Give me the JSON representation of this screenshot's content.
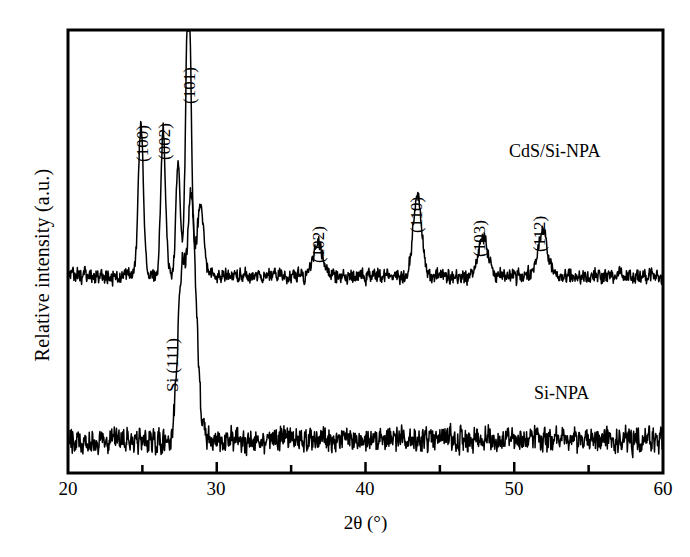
{
  "chart_data": {
    "type": "line",
    "title": "",
    "xlabel": "2θ (°)",
    "ylabel": "Relative intensity (a.u.)",
    "xlim": [
      20,
      60
    ],
    "xticks": [
      20,
      30,
      40,
      50,
      60
    ],
    "xticklabels": [
      "20",
      "30",
      "40",
      "50",
      "60"
    ],
    "xminorticks": [
      25,
      35,
      45,
      55
    ],
    "yticks": [],
    "yticklabels": [],
    "grid": false,
    "legend_position": "inline-right",
    "line_color": "#000000",
    "frame_color": "#000000",
    "background": "#ffffff",
    "series": [
      {
        "name": "CdS/Si-NPA",
        "label_position": {
          "x2theta": 51.0,
          "y_frac": 0.77
        },
        "baseline_frac": 0.445,
        "noise_amplitude_frac": 0.018,
        "peaks": [
          {
            "hkl": "(100)",
            "two_theta": 24.9,
            "height_frac": 0.345,
            "width": 0.17,
            "labeled": true
          },
          {
            "hkl": "(002)",
            "two_theta": 26.4,
            "height_frac": 0.33,
            "width": 0.16,
            "labeled": true
          },
          {
            "hkl": "(101)",
            "two_theta": 28.1,
            "height_frac": 0.7,
            "width": 0.17,
            "labeled": true
          },
          {
            "hkl": "",
            "two_theta": 27.4,
            "height_frac": 0.25,
            "width": 0.15,
            "labeled": false
          },
          {
            "hkl": "",
            "two_theta": 28.9,
            "height_frac": 0.16,
            "width": 0.22,
            "labeled": false
          },
          {
            "hkl": "(102)",
            "two_theta": 36.8,
            "height_frac": 0.075,
            "width": 0.3,
            "labeled": true
          },
          {
            "hkl": "(110)",
            "two_theta": 43.5,
            "height_frac": 0.185,
            "width": 0.28,
            "labeled": true
          },
          {
            "hkl": "(103)",
            "two_theta": 47.9,
            "height_frac": 0.09,
            "width": 0.3,
            "labeled": true
          },
          {
            "hkl": "(112)",
            "two_theta": 51.9,
            "height_frac": 0.105,
            "width": 0.3,
            "labeled": true
          }
        ]
      },
      {
        "name": "Si-NPA",
        "label_position": {
          "x2theta": 51.5,
          "y_frac": 0.235
        },
        "baseline_frac": 0.075,
        "noise_amplitude_frac": 0.03,
        "peaks": [
          {
            "hkl": "Si (111)",
            "two_theta": 28.3,
            "height_frac": 0.54,
            "width": 0.32,
            "labeled": true
          },
          {
            "hkl": "",
            "two_theta": 27.6,
            "height_frac": 0.33,
            "width": 0.25,
            "labeled": false
          }
        ]
      }
    ],
    "peak_label_annotations": [
      {
        "text": "(100)",
        "two_theta": 24.9,
        "anchor_y_frac": 0.4
      },
      {
        "text": "(002)",
        "two_theta": 26.4,
        "anchor_y_frac": 0.39
      },
      {
        "text": "(101)",
        "two_theta": 28.1,
        "anchor_y_frac": 0.755
      },
      {
        "text": "(102)",
        "two_theta": 36.7,
        "anchor_y_frac": 0.125
      },
      {
        "text": "(110)",
        "two_theta": 43.3,
        "anchor_y_frac": 0.24
      },
      {
        "text": "(103)",
        "two_theta": 47.6,
        "anchor_y_frac": 0.145
      },
      {
        "text": "(112)",
        "two_theta": 51.5,
        "anchor_y_frac": 0.165
      },
      {
        "text": "Si (111)",
        "two_theta": 26.1,
        "anchor_y_frac": 0.19
      }
    ]
  },
  "axes": {
    "x_label": "2θ (°)",
    "y_label": "Relative intensity (a.u.)",
    "x_tick_labels": [
      "20",
      "30",
      "40",
      "50",
      "60"
    ]
  },
  "series_labels": {
    "upper": "CdS/Si-NPA",
    "lower": "Si-NPA"
  },
  "peak_labels": {
    "p100": "(100)",
    "p002": "(002)",
    "p101": "(101)",
    "p102": "(102)",
    "p110": "(110)",
    "p103": "(103)",
    "p112": "(112)",
    "si111": "Si (111)"
  }
}
